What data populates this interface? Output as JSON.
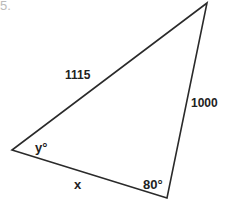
{
  "problem_number": "5.",
  "triangle": {
    "vertices": {
      "left": [
        12,
        150
      ],
      "bottom_right": [
        167,
        198
      ],
      "top": [
        207,
        3
      ]
    },
    "side_labels": {
      "hypotenuse_left_top": "1115",
      "right_side": "1000",
      "bottom_side": "x"
    },
    "angle_labels": {
      "left_angle": "y°",
      "bottom_right_angle": "80°"
    }
  }
}
